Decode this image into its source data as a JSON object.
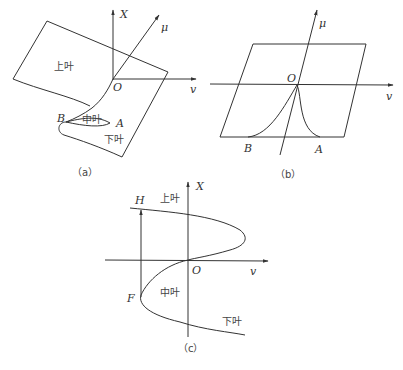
{
  "figure": {
    "panels": [
      {
        "id": "a",
        "caption": "（a）",
        "axes": {
          "vertical": "X",
          "horizontal": "v",
          "oblique": "μ",
          "origin": "O"
        },
        "regions": {
          "upper": "上叶",
          "middle": "中叶",
          "lower": "下叶"
        },
        "points": {
          "B": "B",
          "A": "A"
        }
      },
      {
        "id": "b",
        "caption": "（b）",
        "axes": {
          "horizontal": "v",
          "oblique": "μ",
          "origin": "O"
        },
        "points": {
          "B": "B",
          "A": "A"
        }
      },
      {
        "id": "c",
        "caption": "（c）",
        "axes": {
          "vertical": "X",
          "horizontal": "v",
          "origin": "O"
        },
        "regions": {
          "upper": "上叶",
          "middle": "中叶",
          "lower": "下叶"
        },
        "points": {
          "H": "H",
          "F": "F"
        }
      }
    ],
    "colors": {
      "line": "#333333",
      "background": "#ffffff"
    }
  }
}
